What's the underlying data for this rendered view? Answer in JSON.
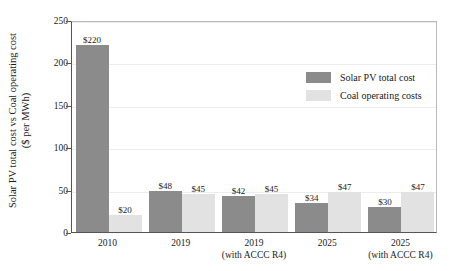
{
  "chart_data": {
    "type": "bar",
    "title": "",
    "subtitle": "",
    "xlabel": "",
    "ylabel_line1": "Solar PV total cost vs Coal operating cost",
    "ylabel_line2": "($ per MWh)",
    "ylim": [
      0,
      250
    ],
    "yticks": [
      0,
      50,
      100,
      150,
      200,
      250
    ],
    "ytick_labels": [
      "0",
      "50",
      "100",
      "150",
      "200",
      "250"
    ],
    "grid": true,
    "legend_position": "upper-right-inside",
    "categories": [
      "2010",
      "2019",
      "2019",
      "2025",
      "2025"
    ],
    "category_sublabels": [
      "",
      "",
      "(with ACCC R4)",
      "",
      "(with ACCC R4)"
    ],
    "series": [
      {
        "name": "Solar PV total cost",
        "color": "#8b8b8b",
        "values": [
          220,
          48,
          42,
          34,
          30
        ],
        "data_labels": [
          "$220",
          "$48",
          "$42",
          "$34",
          "$30"
        ]
      },
      {
        "name": "Coal operating costs",
        "color": "#e2e2e2",
        "values": [
          20,
          45,
          45,
          47,
          47
        ],
        "data_labels": [
          "$20",
          "$45",
          "$45",
          "$47",
          "$47"
        ]
      }
    ]
  },
  "legend": {
    "items": [
      {
        "label": "Solar PV total cost",
        "color": "#8b8b8b"
      },
      {
        "label": "Coal operating costs",
        "color": "#e2e2e2"
      }
    ]
  }
}
